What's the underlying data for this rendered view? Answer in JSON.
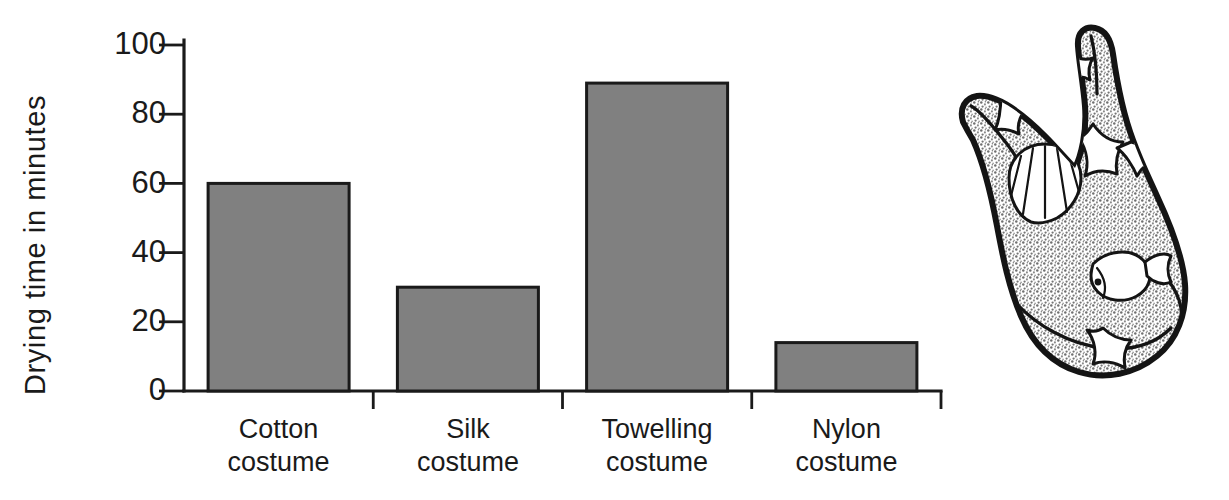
{
  "chart_data": {
    "type": "bar",
    "title": "",
    "xlabel": "",
    "ylabel": "Drying time in minutes",
    "categories": [
      "Cotton costume",
      "Silk costume",
      "Towelling costume",
      "Nylon costume"
    ],
    "category_lines": [
      [
        "Cotton",
        "costume"
      ],
      [
        "Silk",
        "costume"
      ],
      [
        "Towelling",
        "costume"
      ],
      [
        "Nylon",
        "costume"
      ]
    ],
    "values": [
      60,
      30,
      89,
      14
    ],
    "ylim": [
      0,
      100
    ],
    "ytick_labels": [
      "0",
      "20",
      "40",
      "60",
      "80",
      "100"
    ],
    "ytick_values": [
      0,
      20,
      40,
      60,
      80,
      100
    ],
    "grid": false,
    "legend": "none",
    "bar_fill_color": "#808080",
    "bar_stroke_color": "#1a1a1a",
    "background_color": "#ffffff"
  },
  "illustration": {
    "name": "swimming-costume",
    "description": "Hand drawn one piece swimming costume with stippled grey fabric decorated with starfish, a scallop shell and a fish",
    "fabric_color": "#9a9a9a",
    "outline_color": "#141414",
    "motifs": [
      "starfish",
      "starfish",
      "starfish",
      "scallop-shell",
      "fish",
      "starfish"
    ]
  }
}
